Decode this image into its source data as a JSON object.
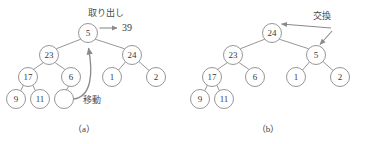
{
  "figure": {
    "background_color": "#ffffff",
    "stroke_color": "#8a8a8a",
    "text_color": "#3a3a3a",
    "panels": [
      {
        "id": "panel-a",
        "caption": "（a）",
        "caption_x": 84,
        "caption_y": 129,
        "nodes": [
          {
            "id": "a-root",
            "label": "5",
            "cx": 88,
            "cy": 33,
            "r": 9.5,
            "empty": false
          },
          {
            "id": "a-n23",
            "label": "23",
            "cx": 49,
            "cy": 55,
            "r": 9.5,
            "empty": false
          },
          {
            "id": "a-n24",
            "label": "24",
            "cx": 132,
            "cy": 55,
            "r": 9.5,
            "empty": false
          },
          {
            "id": "a-n17",
            "label": "17",
            "cx": 28,
            "cy": 77,
            "r": 9.5,
            "empty": false
          },
          {
            "id": "a-n6",
            "label": "6",
            "cx": 71,
            "cy": 77,
            "r": 9.5,
            "empty": false
          },
          {
            "id": "a-n1",
            "label": "1",
            "cx": 112,
            "cy": 77,
            "r": 9.5,
            "empty": false
          },
          {
            "id": "a-n2",
            "label": "2",
            "cx": 156,
            "cy": 77,
            "r": 9.5,
            "empty": false
          },
          {
            "id": "a-n9",
            "label": "9",
            "cx": 16,
            "cy": 99,
            "r": 9.5,
            "empty": false
          },
          {
            "id": "a-n11",
            "label": "11",
            "cx": 40,
            "cy": 99,
            "r": 9.5,
            "empty": false
          },
          {
            "id": "a-empty",
            "label": "",
            "cx": 64,
            "cy": 99,
            "r": 9.5,
            "empty": true
          }
        ],
        "edges": [
          {
            "from": "a-root",
            "to": "a-n23"
          },
          {
            "from": "a-root",
            "to": "a-n24"
          },
          {
            "from": "a-n23",
            "to": "a-n17"
          },
          {
            "from": "a-n23",
            "to": "a-n6"
          },
          {
            "from": "a-n24",
            "to": "a-n1"
          },
          {
            "from": "a-n24",
            "to": "a-n2"
          },
          {
            "from": "a-n17",
            "to": "a-n9"
          },
          {
            "from": "a-n17",
            "to": "a-n11"
          },
          {
            "from": "a-n6",
            "to": "a-empty"
          }
        ],
        "annotations": [
          {
            "id": "extract-label",
            "text": "取り出し",
            "x": 106,
            "y": 13
          },
          {
            "id": "extracted-value",
            "text": "39",
            "x": 127,
            "y": 27
          },
          {
            "id": "move-label",
            "text": "移動",
            "x": 92,
            "y": 100
          }
        ]
      },
      {
        "id": "panel-b",
        "caption": "（b）",
        "caption_x": 268,
        "caption_y": 129,
        "nodes": [
          {
            "id": "b-root",
            "label": "24",
            "cx": 272,
            "cy": 33,
            "r": 9.5,
            "empty": false
          },
          {
            "id": "b-n23",
            "label": "23",
            "cx": 233,
            "cy": 55,
            "r": 9.5,
            "empty": false
          },
          {
            "id": "b-n5",
            "label": "5",
            "cx": 316,
            "cy": 55,
            "r": 9.5,
            "empty": false
          },
          {
            "id": "b-n17",
            "label": "17",
            "cx": 212,
            "cy": 77,
            "r": 9.5,
            "empty": false
          },
          {
            "id": "b-n6",
            "label": "6",
            "cx": 255,
            "cy": 77,
            "r": 9.5,
            "empty": false
          },
          {
            "id": "b-n1",
            "label": "1",
            "cx": 296,
            "cy": 77,
            "r": 9.5,
            "empty": false
          },
          {
            "id": "b-n2",
            "label": "2",
            "cx": 340,
            "cy": 77,
            "r": 9.5,
            "empty": false
          },
          {
            "id": "b-n9",
            "label": "9",
            "cx": 200,
            "cy": 99,
            "r": 9.5,
            "empty": false
          },
          {
            "id": "b-n11",
            "label": "11",
            "cx": 224,
            "cy": 99,
            "r": 9.5,
            "empty": false
          }
        ],
        "edges": [
          {
            "from": "b-root",
            "to": "b-n23"
          },
          {
            "from": "b-root",
            "to": "b-n5"
          },
          {
            "from": "b-n23",
            "to": "b-n17"
          },
          {
            "from": "b-n23",
            "to": "b-n6"
          },
          {
            "from": "b-n5",
            "to": "b-n1"
          },
          {
            "from": "b-n5",
            "to": "b-n2"
          },
          {
            "from": "b-n17",
            "to": "b-n9"
          },
          {
            "from": "b-n17",
            "to": "b-n11"
          }
        ],
        "annotations": [
          {
            "id": "swap-label",
            "text": "交換",
            "x": 320,
            "y": 16
          }
        ]
      }
    ]
  }
}
